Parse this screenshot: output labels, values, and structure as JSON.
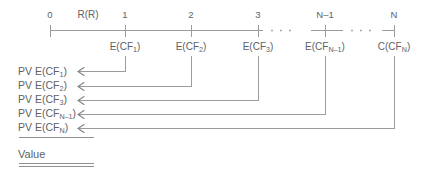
{
  "figure": {
    "type": "timeline-cash-flow-diagram",
    "line_color": "#9a9da0",
    "text_color": "#5e6266",
    "axis": {
      "label_rate": "R(R)",
      "ellipsis": "· · ·",
      "periods": [
        {
          "label": "0",
          "x": 50
        },
        {
          "label": "1",
          "x": 125
        },
        {
          "label": "2",
          "x": 191
        },
        {
          "label": "3",
          "x": 258
        },
        {
          "label": "N–1",
          "x": 325
        },
        {
          "label": "N",
          "x": 394
        }
      ]
    },
    "cash_flows": [
      {
        "label_prefix": "E(CF",
        "label_sub": "1",
        "label_suffix": ")",
        "x": 125
      },
      {
        "label_prefix": "E(CF",
        "label_sub": "2",
        "label_suffix": ")",
        "x": 191
      },
      {
        "label_prefix": "E(CF",
        "label_sub": "3",
        "label_suffix": ")",
        "x": 258
      },
      {
        "label_prefix": "E(CF",
        "label_sub": "N–1",
        "label_suffix": ")",
        "x": 325
      },
      {
        "label_prefix": "C(CF",
        "label_sub": "N",
        "label_suffix": ")",
        "x": 394
      }
    ],
    "pv_rows": [
      {
        "prefix": "PV E(CF",
        "sub": "1",
        "suffix": ")",
        "y": 71,
        "source_x": 125
      },
      {
        "prefix": "PV E(CF",
        "sub": "2",
        "suffix": ")",
        "y": 86,
        "source_x": 191
      },
      {
        "prefix": "PV E(CF",
        "sub": "3",
        "suffix": ")",
        "y": 100,
        "source_x": 258
      },
      {
        "prefix": "PV E(CF",
        "sub": "N–1",
        "suffix": ")",
        "y": 114,
        "source_x": 325
      },
      {
        "prefix": "PV E(CF",
        "sub": "N",
        "suffix": ")",
        "y": 128,
        "source_x": 394
      }
    ],
    "total": {
      "label": "Value"
    }
  }
}
